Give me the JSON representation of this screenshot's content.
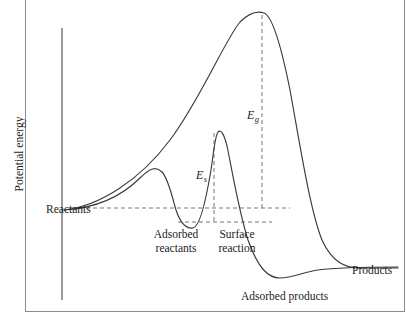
{
  "figure": {
    "axis": {
      "ylabel": "Potential energy",
      "xlabel": "",
      "y_axis_x": 62,
      "y_axis_top": 28,
      "y_axis_bottom": 300
    },
    "labels": {
      "reactants": "Reactants",
      "adsorbed_reactants_line1": "Adsorbed",
      "adsorbed_reactants_line2": "reactants",
      "surface_reaction_line1": "Surface",
      "surface_reaction_line2": "reaction",
      "adsorbed_products": "Adsorbed products",
      "products": "Products"
    },
    "annotations": {
      "gas_activation_symbol": "E",
      "gas_activation_subscript": "g",
      "surface_activation_symbol": "E",
      "surface_activation_subscript": "s"
    },
    "colors": {
      "curve": "#3b3b3b",
      "axis": "#4a4a4a",
      "guide": "#777777",
      "frame": "#8c8c8c",
      "background": "#ffffff",
      "text": "#1c1c1c"
    }
  },
  "chart_data": {
    "type": "line",
    "title": "",
    "xlabel": "Reaction coordinate",
    "ylabel": "Potential energy",
    "grid": false,
    "legend": "none",
    "axis_ranges": {
      "x_pixels": [
        62,
        400
      ],
      "y_pixels": [
        10,
        300
      ]
    },
    "reference_levels": {
      "reactant_level_y": 208,
      "adsorbed_reactant_level_y": 222,
      "product_level_y": 268
    },
    "series": [
      {
        "name": "Uncatalyzed gas-phase pathway",
        "description": "Single large activation barrier E_g from reactants to products",
        "path": "M 64 210 C 100 206 140 180 170 140 C 200 100 225 40 240 22 C 250 12 258 11 264 13 C 272 16 280 40 290 90 C 300 145 310 210 322 240 C 332 262 345 268 360 268 L 398 268",
        "key_points": [
          {
            "label": "reactants start",
            "x": 64,
            "y": 210
          },
          {
            "label": "gas peak apex",
            "x": 262,
            "y": 13
          },
          {
            "label": "products plateau",
            "x": 398,
            "y": 268
          }
        ]
      },
      {
        "name": "Catalyzed surface pathway",
        "description": "Lower barrier E_s with adsorbed reactant and adsorbed product wells",
        "path": "M 64 210 C 96 208 122 196 140 178 C 150 168 156 166 162 172 C 168 178 172 196 176 210 C 180 222 186 229 193 228 C 200 227 206 200 211 170 C 214 150 215 136 218 132 C 221 129 224 134 227 146 C 231 164 238 208 248 240 C 258 268 268 278 280 278 C 292 278 304 272 318 270 C 340 267 370 267 398 267",
        "key_points": [
          {
            "label": "reactants start",
            "x": 64,
            "y": 210
          },
          {
            "label": "adsorption hump",
            "x": 161,
            "y": 167
          },
          {
            "label": "adsorbed reactants well",
            "x": 193,
            "y": 228
          },
          {
            "label": "surface reaction peak",
            "x": 217,
            "y": 131
          },
          {
            "label": "adsorbed products well",
            "x": 283,
            "y": 278
          },
          {
            "label": "products plateau",
            "x": 398,
            "y": 267
          }
        ]
      }
    ],
    "guides": [
      {
        "name": "reactant-level-dashed",
        "type": "horizontal",
        "x1": 72,
        "y1": 208,
        "x2": 290,
        "y2": 208
      },
      {
        "name": "adsorbed-level-dashed",
        "type": "horizontal",
        "x1": 178,
        "y1": 222,
        "x2": 272,
        "y2": 222
      },
      {
        "name": "gas-activation-dashed",
        "type": "vertical",
        "x1": 262,
        "y1": 15,
        "x2": 262,
        "y2": 210
      },
      {
        "name": "surface-activation-dashed",
        "type": "vertical",
        "x1": 214,
        "y1": 133,
        "x2": 214,
        "y2": 224
      }
    ]
  }
}
